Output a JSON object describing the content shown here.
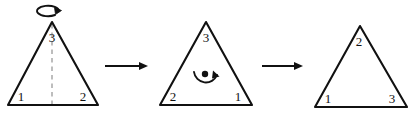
{
  "figure": {
    "background_color": "#ffffff",
    "stroke_color": "#111111",
    "axis_color": "#9a9a9a"
  },
  "panels": [
    {
      "name": "initial-triangle",
      "vertices": {
        "top": "3",
        "bottom_left": "1",
        "bottom_right": "2"
      },
      "axis": {
        "visible": "true",
        "style": "dashed",
        "orientation": "vertical"
      },
      "operation_symbol": {
        "name": "flip-loop-arrow",
        "kind": "loop-about-vertical-axis",
        "position": "above-apex"
      }
    },
    {
      "name": "flipped-triangle",
      "vertices": {
        "top": "3",
        "bottom_left": "2",
        "bottom_right": "1"
      },
      "axis": {
        "visible": "false",
        "style": "none",
        "orientation": "none"
      },
      "operation_symbol": {
        "name": "rotation-arc-arrow",
        "kind": "rotation-about-center",
        "position": "center"
      }
    },
    {
      "name": "rotated-triangle",
      "vertices": {
        "top": "2",
        "bottom_left": "1",
        "bottom_right": "3"
      },
      "axis": {
        "visible": "false",
        "style": "none",
        "orientation": "none"
      },
      "operation_symbol": {
        "name": "none",
        "kind": "none",
        "position": "none"
      }
    }
  ],
  "connectors": [
    {
      "name": "arrow-one",
      "direction": "right"
    },
    {
      "name": "arrow-two",
      "direction": "right"
    }
  ]
}
